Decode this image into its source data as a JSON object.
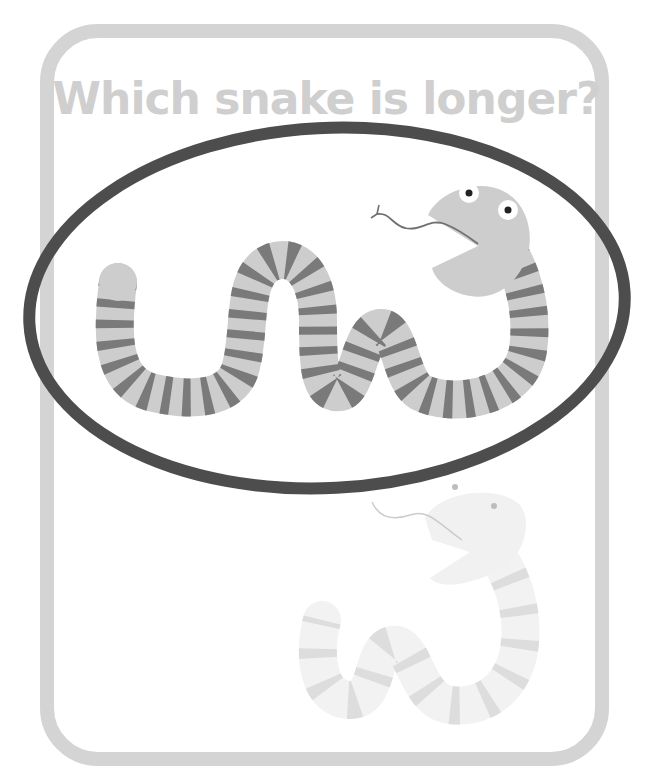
{
  "worksheet": {
    "title": "Which snake is longer?",
    "colors": {
      "card_border": "#d4d4d4",
      "title_text": "#cfcfcf",
      "snake_body": "#cdcdcd",
      "snake_stripe": "#7a7a7a",
      "circle_mark": "#4d4d4d",
      "faded_body": "#f3f3f3",
      "faded_stripe": "#dedede"
    },
    "snakes": [
      {
        "id": "top-snake",
        "circled": true,
        "label": "longer snake (circled)"
      },
      {
        "id": "bottom-snake",
        "circled": false,
        "label": "shorter snake (faded)"
      }
    ]
  }
}
